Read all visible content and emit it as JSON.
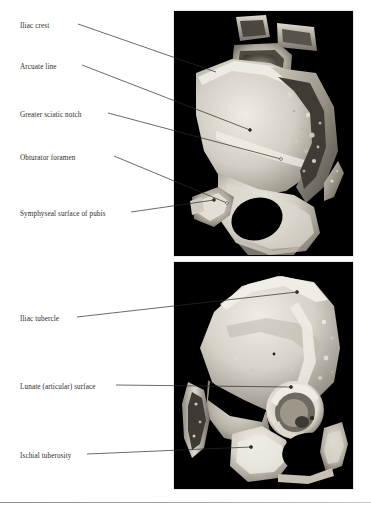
{
  "figure": {
    "type": "anatomical-plate",
    "panels": [
      {
        "id": "panel-top",
        "name": "medial-view-hemipelvis",
        "background_color": "#000000",
        "labels": [
          {
            "id": "iliac-crest",
            "text": "Iliac crest",
            "text_x": 20,
            "text_y": 27,
            "leader": {
              "x1": 78,
              "y1": 24,
              "x2": 216,
              "y2": 72
            },
            "dot": false
          },
          {
            "id": "arcuate-line",
            "text": "Arcuate line",
            "text_x": 20,
            "text_y": 68,
            "leader": {
              "x1": 82,
              "y1": 65,
              "x2": 250,
              "y2": 130
            },
            "dot": true
          },
          {
            "id": "greater-sciatic-notch",
            "text": "Greater sciatic notch",
            "text_x": 20,
            "text_y": 116,
            "leader": {
              "x1": 108,
              "y1": 113,
              "x2": 281,
              "y2": 159
            },
            "dot": true
          },
          {
            "id": "obturator-foramen",
            "text": "Obturator foramen",
            "text_x": 20,
            "text_y": 159,
            "leader": {
              "x1": 114,
              "y1": 156,
              "x2": 227,
              "y2": 203
            },
            "dot": true
          },
          {
            "id": "symphyseal-surface-of-pubis",
            "text": "Symphyseal surface of pubis",
            "text_x": 20,
            "text_y": 215,
            "leader": {
              "x1": 131,
              "y1": 212,
              "x2": 214,
              "y2": 200
            },
            "dot": true
          }
        ]
      },
      {
        "id": "panel-bottom",
        "name": "lateral-view-hemipelvis",
        "background_color": "#000000",
        "labels": [
          {
            "id": "iliac-tubercle",
            "text": "Iliac tubercle",
            "text_x": 20,
            "text_y": 320,
            "leader": {
              "x1": 77,
              "y1": 317,
              "x2": 297,
              "y2": 292
            },
            "dot": true
          },
          {
            "id": "lunate-articular-surface",
            "text": "Lunate (articular) surface",
            "text_x": 20,
            "text_y": 388,
            "leader": {
              "x1": 116,
              "y1": 385,
              "x2": 291,
              "y2": 387
            },
            "dot": true
          },
          {
            "id": "ischial-tuberosity",
            "text": "Ischial tuberosity",
            "text_x": 20,
            "text_y": 457,
            "leader": {
              "x1": 87,
              "y1": 454,
              "x2": 251,
              "y2": 447
            },
            "dot": true
          }
        ]
      }
    ]
  },
  "colors": {
    "page_background": "#ffffff",
    "panel_background": "#000000",
    "label_text": "#2b2b2b",
    "leader_line": "#2b2b2b",
    "rule": "#8d8d8d",
    "bone_light": "#e9e6de",
    "bone_mid": "#b8b3a8",
    "bone_dark": "#6f6a60"
  }
}
